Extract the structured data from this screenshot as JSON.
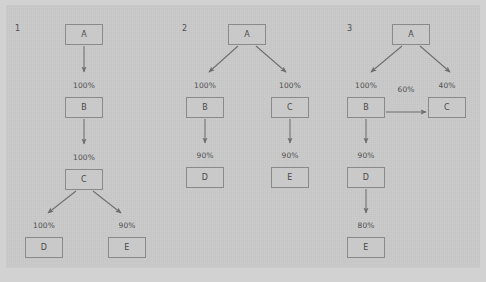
{
  "figure": {
    "background_color": "#d2d2d2",
    "canvas_color": "#c9c9c9",
    "node_fill": "#c9c9c9",
    "node_border": "#8a8a8a",
    "text_color": "#4f4f4f",
    "arrow_color": "#6e6e6e"
  },
  "panels": [
    {
      "number": "1",
      "nodes": [
        {
          "id": "p1-A",
          "label": "A",
          "x": 65,
          "y": 24
        },
        {
          "id": "p1-B",
          "label": "B",
          "x": 65,
          "y": 97
        },
        {
          "id": "p1-C",
          "label": "C",
          "x": 65,
          "y": 169
        },
        {
          "id": "p1-D",
          "label": "D",
          "x": 25,
          "y": 237
        },
        {
          "id": "p1-E",
          "label": "E",
          "x": 108,
          "y": 237
        }
      ],
      "edges": [
        {
          "from": "A",
          "to": "B",
          "label": "100%",
          "label_x": 84,
          "label_y": 81
        },
        {
          "from": "B",
          "to": "C",
          "label": "100%",
          "label_x": 84,
          "label_y": 153
        },
        {
          "from": "C",
          "to": "D",
          "label": "100%",
          "label_x": 44,
          "label_y": 221
        },
        {
          "from": "C",
          "to": "E",
          "label": "90%",
          "label_x": 127,
          "label_y": 221
        }
      ],
      "num_x": 15,
      "num_y": 24
    },
    {
      "number": "2",
      "nodes": [
        {
          "id": "p2-A",
          "label": "A",
          "x": 228,
          "y": 24
        },
        {
          "id": "p2-B",
          "label": "B",
          "x": 186,
          "y": 97
        },
        {
          "id": "p2-C",
          "label": "C",
          "x": 271,
          "y": 97
        },
        {
          "id": "p2-D",
          "label": "D",
          "x": 186,
          "y": 167
        },
        {
          "id": "p2-E",
          "label": "E",
          "x": 271,
          "y": 167
        }
      ],
      "edges": [
        {
          "from": "A",
          "to": "B",
          "label": "100%",
          "label_x": 205,
          "label_y": 81
        },
        {
          "from": "A",
          "to": "C",
          "label": "100%",
          "label_x": 290,
          "label_y": 81
        },
        {
          "from": "B",
          "to": "D",
          "label": "90%",
          "label_x": 205,
          "label_y": 151
        },
        {
          "from": "C",
          "to": "E",
          "label": "90%",
          "label_x": 290,
          "label_y": 151
        }
      ],
      "num_x": 182,
      "num_y": 24
    },
    {
      "number": "3",
      "nodes": [
        {
          "id": "p3-A",
          "label": "A",
          "x": 392,
          "y": 24
        },
        {
          "id": "p3-B",
          "label": "B",
          "x": 347,
          "y": 97
        },
        {
          "id": "p3-C",
          "label": "C",
          "x": 428,
          "y": 97
        },
        {
          "id": "p3-D",
          "label": "D",
          "x": 347,
          "y": 167
        },
        {
          "id": "p3-E",
          "label": "E",
          "x": 347,
          "y": 237
        }
      ],
      "edges": [
        {
          "from": "A",
          "to": "B",
          "label": "100%",
          "label_x": 366,
          "label_y": 81
        },
        {
          "from": "A",
          "to": "C",
          "label": "40%",
          "label_x": 447,
          "label_y": 81
        },
        {
          "from": "B",
          "to": "C",
          "label": "60%",
          "label_x": 406,
          "label_y": 85
        },
        {
          "from": "B",
          "to": "D",
          "label": "90%",
          "label_x": 366,
          "label_y": 151
        },
        {
          "from": "D",
          "to": "E",
          "label": "80%",
          "label_x": 366,
          "label_y": 221
        }
      ],
      "num_x": 347,
      "num_y": 24
    }
  ]
}
